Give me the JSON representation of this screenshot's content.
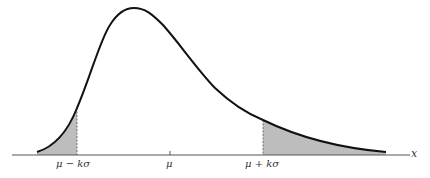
{
  "figure": {
    "type": "skewed probability density with shaded tails",
    "axis_label": "x",
    "tick_labels": {
      "left": "μ − kσ",
      "center": "μ",
      "right": "μ + kσ"
    },
    "colors": {
      "curve": "#111111",
      "shade": "#bdbdbd",
      "axis": "#555555"
    }
  }
}
